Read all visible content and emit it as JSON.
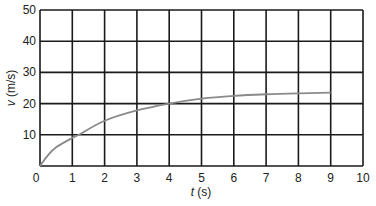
{
  "chart_data": {
    "type": "line",
    "title": "",
    "xlabel": "t (s)",
    "ylabel": "v (m/s)",
    "xlabel_var": "t",
    "xlabel_unit": " (s)",
    "ylabel_var": "v",
    "ylabel_unit": " (m/s)",
    "xlim": [
      0,
      10
    ],
    "ylim": [
      0,
      50
    ],
    "x_ticks": [
      0,
      1,
      2,
      3,
      4,
      5,
      6,
      7,
      8,
      9,
      10
    ],
    "y_ticks": [
      10,
      20,
      30,
      40,
      50
    ],
    "grid": true,
    "legend": null,
    "series": [
      {
        "name": "velocity",
        "color": "#8a8a8a",
        "x": [
          0,
          0.25,
          0.5,
          1,
          1.2,
          2,
          3,
          4,
          5,
          6,
          7,
          8,
          9
        ],
        "y": [
          0,
          3.5,
          6,
          9,
          10,
          14.5,
          17.8,
          20,
          21.6,
          22.5,
          23.0,
          23.3,
          23.5
        ]
      }
    ]
  },
  "colors": {
    "grid": "#1a1a1a",
    "curve": "#8a8a8a",
    "background": "#ffffff"
  }
}
